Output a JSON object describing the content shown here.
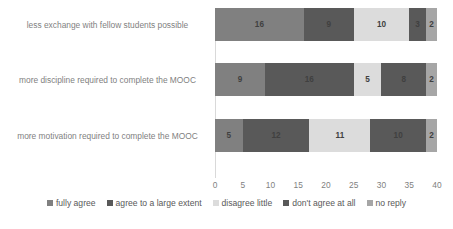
{
  "chart_data": {
    "type": "bar",
    "orientation": "horizontal",
    "stacked": true,
    "title": "",
    "xlabel": "",
    "ylabel": "",
    "xlim": [
      0,
      40
    ],
    "xticks": [
      0,
      5,
      10,
      15,
      20,
      25,
      30,
      35,
      40
    ],
    "grid": false,
    "legend_position": "bottom",
    "categories": [
      "less exchange with fellow students possible",
      "more discipline required  to complete the MOOC",
      "more motivation required to complete the MOOC"
    ],
    "series": [
      {
        "name": "fully agree",
        "color": "#808080",
        "values": [
          16,
          9,
          5
        ]
      },
      {
        "name": "agree to a large extent",
        "color": "#595959",
        "values": [
          9,
          16,
          12
        ]
      },
      {
        "name": "disagree little",
        "color": "#dcdcdc",
        "values": [
          10,
          5,
          11
        ]
      },
      {
        "name": "don't agree at all",
        "color": "#595959",
        "values": [
          3,
          8,
          10
        ]
      },
      {
        "name": "no reply",
        "color": "#a6a6a6",
        "values": [
          2,
          2,
          2
        ]
      }
    ],
    "totals": [
      40,
      40,
      40
    ]
  },
  "axis": {
    "line_color": "#d9d9d9",
    "tick_color": "#7f7f7f"
  },
  "labels": {
    "category_color": "#7f7f7f",
    "value_color": "#404040"
  }
}
